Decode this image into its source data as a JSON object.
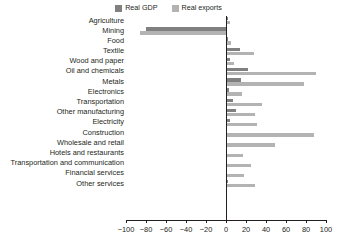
{
  "chart_data": {
    "type": "bar",
    "orientation": "horizontal",
    "title": "",
    "subtitle": "",
    "xlabel": "",
    "ylabel": "",
    "xlim": [
      -100,
      100
    ],
    "xticks": [
      -100,
      -80,
      -60,
      -40,
      -20,
      0,
      20,
      40,
      60,
      80,
      100
    ],
    "xtick_labels": [
      "-100",
      "-80",
      "-60",
      "-40",
      "-20",
      "0",
      "20",
      "40",
      "60",
      "80",
      "100"
    ],
    "grid": false,
    "legend_position": "top-center",
    "categories": [
      "Agriculture",
      "Mining",
      "Food",
      "Textile",
      "Wood and paper",
      "Oil and chemicals",
      "Metals",
      "Electronics",
      "Transportation",
      "Other manufacturing",
      "Electricity",
      "Construction",
      "Wholesale and retail",
      "Hotels and restaurants",
      "Transportation and communication",
      "Financial services",
      "Other services"
    ],
    "series": [
      {
        "name": "Real GDP",
        "color": "#808080",
        "values": [
          2,
          -80,
          2,
          14,
          4,
          22,
          15,
          3,
          7,
          10,
          4,
          1,
          1,
          1,
          1,
          1,
          2
        ]
      },
      {
        "name": "Real exports",
        "color": "#b3b3b3",
        "values": [
          4,
          -86,
          5,
          28,
          8,
          90,
          78,
          16,
          36,
          29,
          31,
          88,
          49,
          17,
          25,
          18,
          29
        ]
      }
    ]
  },
  "legend": {
    "entries": [
      {
        "label": "Real GDP",
        "swatch_name": "legend-swatch-real-gdp"
      },
      {
        "label": "Real exports",
        "swatch_name": "legend-swatch-real-exports"
      }
    ]
  }
}
